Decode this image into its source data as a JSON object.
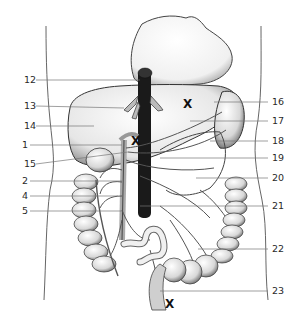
{
  "diagram": {
    "type": "anatomical-illustration",
    "left_labels": [
      {
        "text": "12",
        "y": 80
      },
      {
        "text": "13",
        "y": 106
      },
      {
        "text": "14",
        "y": 126
      },
      {
        "text": "1",
        "y": 145
      },
      {
        "text": "15",
        "y": 164
      },
      {
        "text": "2",
        "y": 181
      },
      {
        "text": "4",
        "y": 196
      },
      {
        "text": "5",
        "y": 211
      }
    ],
    "right_labels": [
      {
        "text": "16",
        "y": 102
      },
      {
        "text": "17",
        "y": 121
      },
      {
        "text": "18",
        "y": 141
      },
      {
        "text": "19",
        "y": 158
      },
      {
        "text": "20",
        "y": 178
      },
      {
        "text": "21",
        "y": 206
      },
      {
        "text": "22",
        "y": 249
      },
      {
        "text": "23",
        "y": 291
      }
    ],
    "markers": [
      {
        "text": "X",
        "x": 186,
        "y": 104
      },
      {
        "text": "X",
        "x": 135,
        "y": 141
      },
      {
        "text": "X",
        "x": 168,
        "y": 304
      }
    ]
  }
}
